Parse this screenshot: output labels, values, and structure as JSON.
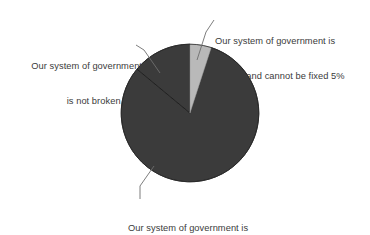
{
  "chart_data": {
    "type": "pie",
    "title": "",
    "subtitle": "",
    "xlabel": "",
    "ylabel": "",
    "legend_position": "none",
    "grid": false,
    "labels_style": "leader-line callouts",
    "start_angle_deg": -90,
    "direction": "clockwise",
    "categories": [
      "Our system of government is broken and cannot be fixed",
      "Our system of government is broken but can be fixed",
      "Our system of government is not broken"
    ],
    "values": [
      5,
      81,
      14
    ],
    "value_unit": "%",
    "colors": [
      "#b9b9b9",
      "#3b3b3b",
      "#3b3b3b"
    ],
    "slices": [
      {
        "name": "cannot-be-fixed",
        "label_line_1": "Our system of government is",
        "label_line_2": "broken and cannot be fixed 5%",
        "value": 5,
        "color": "#b9b9b9"
      },
      {
        "name": "can-be-fixed",
        "label_line_1": "Our system of government is",
        "label_line_2": "broken but can be fixed 81%",
        "value": 81,
        "color": "#3b3b3b"
      },
      {
        "name": "not-broken",
        "label_line_1": "Our system of government",
        "label_line_2": "is not broken 14%",
        "value": 14,
        "color": "#3b3b3b"
      }
    ]
  },
  "labels": {
    "cannot_fixed": {
      "line1": "Our system of government is",
      "line2": "broken and cannot be fixed 5%"
    },
    "can_fixed": {
      "line1": "Our system of government is",
      "line2": "broken but can be fixed 81%"
    },
    "not_broken": {
      "line1": "Our system of government",
      "line2": "is not broken 14%"
    }
  },
  "colors": {
    "background": "#ffffff",
    "slice_light": "#b9b9b9",
    "slice_dark": "#3b3b3b",
    "text": "#3b3b3b",
    "leader_line": "#6e6e6e",
    "separator": "#1e1e1e"
  }
}
